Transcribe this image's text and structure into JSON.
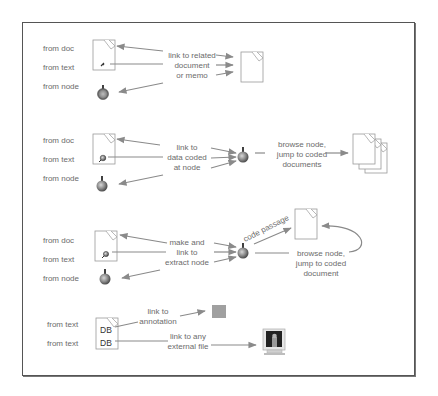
{
  "sections": [
    {
      "sources": [
        "from doc",
        "from text",
        "from node"
      ],
      "action_label": [
        "link to related",
        "document",
        "or memo"
      ],
      "target": "document"
    },
    {
      "sources": [
        "from doc",
        "from text",
        "from node"
      ],
      "action_label": [
        "link to",
        "data coded",
        "at node"
      ],
      "target": "node",
      "followup_label": [
        "browse node,",
        "jump to coded",
        "documents"
      ],
      "followup_target": "documents"
    },
    {
      "sources": [
        "from doc",
        "from text",
        "from node"
      ],
      "action_label": [
        "make and",
        "link to",
        "extract node"
      ],
      "target": "node",
      "code_label": "code passage",
      "followup_label": [
        "browse node,",
        "jump to coded",
        "document"
      ],
      "followup_target": "document"
    },
    {
      "sources": [
        "from text",
        "from text"
      ],
      "markers": [
        "DB",
        "DB"
      ],
      "annotation_label": [
        "link to",
        "annotation"
      ],
      "file_label": [
        "link to any",
        "external file"
      ]
    }
  ],
  "colors": {
    "line": "#8a8a8a",
    "text": "#6b6b6b",
    "annotation": "#a0a0a0",
    "frame": "#555555"
  }
}
